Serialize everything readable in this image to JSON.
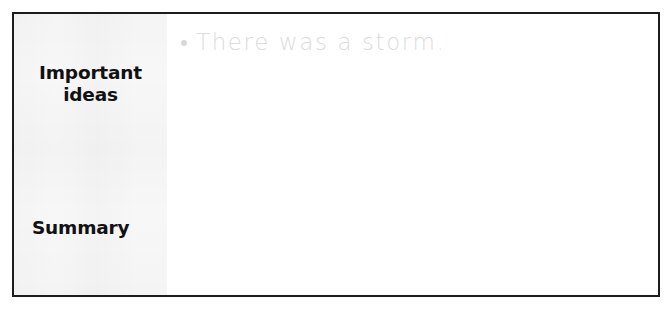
{
  "worksheet": {
    "frame_color": "#1c1c1c",
    "paper_color": "#ffffff",
    "label_column": {
      "background_color": "#f7f7f7",
      "labels": [
        {
          "id": "important-ideas",
          "text": "Important\nideas",
          "line1": "Important",
          "line2": "ideas",
          "color": "#111111"
        },
        {
          "id": "summary",
          "text": "Summary",
          "color": "#111111"
        }
      ]
    },
    "content": {
      "placeholder_color": "#dcdcdc",
      "bullet_glyph": "bullet-dot",
      "entries": [
        {
          "id": "entry-1",
          "text": "There was a storm."
        }
      ]
    }
  }
}
